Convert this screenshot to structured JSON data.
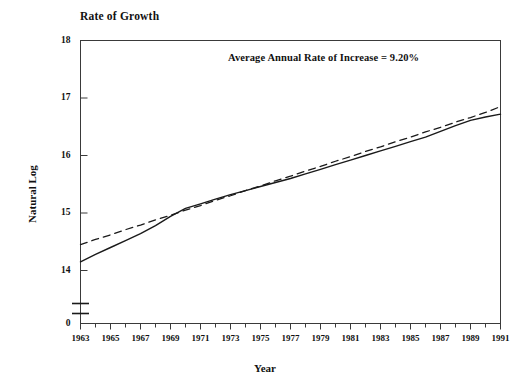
{
  "chart_data": {
    "type": "line",
    "title": "Rate of Growth",
    "xlabel": "Year",
    "ylabel": "Natural Log",
    "annotation": "Average Annual Rate of Increase = 9.20%",
    "grid": false,
    "legend_position": "none",
    "xlim": [
      1963,
      1991
    ],
    "ylim": [
      14,
      18
    ],
    "y_axis_break": true,
    "y_break_label": "0",
    "ytick_labels": [
      "18",
      "17",
      "16",
      "15",
      "14",
      "0"
    ],
    "yticks": [
      18,
      17,
      16,
      15,
      14,
      0
    ],
    "xtick_labels": [
      "1963",
      "1965",
      "1967",
      "1969",
      "1971",
      "1973",
      "1975",
      "1977",
      "1979",
      "1981",
      "1983",
      "1985",
      "1987",
      "1989",
      "1991"
    ],
    "xticks": [
      1963,
      1965,
      1967,
      1969,
      1971,
      1973,
      1975,
      1977,
      1979,
      1981,
      1983,
      1985,
      1987,
      1989,
      1991
    ],
    "x_minor_ticks_every": 1,
    "x": [
      1963,
      1964,
      1965,
      1966,
      1967,
      1968,
      1969,
      1970,
      1971,
      1972,
      1973,
      1974,
      1975,
      1976,
      1977,
      1978,
      1979,
      1980,
      1981,
      1982,
      1983,
      1984,
      1985,
      1986,
      1987,
      1988,
      1989,
      1990,
      1991
    ],
    "series": [
      {
        "name": "Natural Log of Series",
        "style": "solid",
        "color": "#1a1a1a",
        "values": [
          14.15,
          14.28,
          14.4,
          14.52,
          14.64,
          14.78,
          14.94,
          15.08,
          15.16,
          15.24,
          15.32,
          15.39,
          15.46,
          15.53,
          15.6,
          15.68,
          15.76,
          15.84,
          15.92,
          16.0,
          16.08,
          16.16,
          16.24,
          16.32,
          16.42,
          16.52,
          16.61,
          16.67,
          16.72
        ]
      },
      {
        "name": "Trend Line (9.20% Average Annual Rate of Increase)",
        "style": "dashed",
        "color": "#1a1a1a",
        "values": [
          14.45,
          14.54,
          14.62,
          14.71,
          14.79,
          14.88,
          14.96,
          15.05,
          15.13,
          15.22,
          15.3,
          15.39,
          15.47,
          15.56,
          15.64,
          15.73,
          15.81,
          15.9,
          15.98,
          16.07,
          16.15,
          16.24,
          16.32,
          16.41,
          16.49,
          16.58,
          16.66,
          16.75,
          16.85
        ]
      }
    ]
  }
}
